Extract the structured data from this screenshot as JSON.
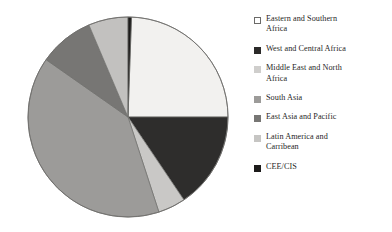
{
  "chart_data": {
    "type": "pie",
    "title": "",
    "subtitle": "",
    "xlabel": "",
    "ylabel": "",
    "grid": false,
    "legend_position": "right",
    "start_angle_deg": 0,
    "direction": "clockwise",
    "categories": [
      "Eastern and Southern Africa",
      "West and Central Africa",
      "Middle East and North Africa",
      "South Asia",
      "East Asia and Pacific",
      "Latin America and Carribean",
      "CEE/CIS"
    ],
    "values": [
      24.4,
      15.6,
      4.4,
      39.7,
      8.9,
      6.4,
      0.6
    ],
    "unit": "percent",
    "slice_colors": [
      "#f2f1ef",
      "#2e2d2c",
      "#c9c8c6",
      "#9c9b99",
      "#777674",
      "#c2c1bf",
      "#1c1b1a"
    ],
    "slices": [
      {
        "label": "Eastern and Southern Africa",
        "value": 24.4,
        "start_deg": 2,
        "end_deg": 90,
        "color": "#f2f1ef"
      },
      {
        "label": "West and Central Africa",
        "value": 15.6,
        "start_deg": 90,
        "end_deg": 146,
        "color": "#2e2d2c"
      },
      {
        "label": "Middle East and North Africa",
        "value": 4.4,
        "start_deg": 146,
        "end_deg": 162,
        "color": "#c9c8c6"
      },
      {
        "label": "South Asia",
        "value": 39.7,
        "start_deg": 162,
        "end_deg": 305,
        "color": "#9c9b99"
      },
      {
        "label": "East Asia and Pacific",
        "value": 8.9,
        "start_deg": 305,
        "end_deg": 337,
        "color": "#777674"
      },
      {
        "label": "Latin America and Carribean",
        "value": 6.4,
        "start_deg": 337,
        "end_deg": 360,
        "color": "#c2c1bf"
      },
      {
        "label": "CEE/CIS",
        "value": 0.6,
        "start_deg": 0,
        "end_deg": 2,
        "color": "#1c1b1a"
      }
    ],
    "outline_color": "#6f6e6c"
  },
  "legend": {
    "items": [
      {
        "label": "Eastern and Southern\nAfrica",
        "swatch_name": "legend-swatch-eastern-and-southern-africa",
        "fill": "#ffffff",
        "border": "#6b6a68"
      },
      {
        "label": "West and Central Africa",
        "swatch_name": "legend-swatch-west-and-central-africa",
        "fill": "#2b2a29",
        "border": "#2b2a29"
      },
      {
        "label": "Middle East and North\nAfrica",
        "swatch_name": "legend-swatch-middle-east-and-north-africa",
        "fill": "#cfcecc",
        "border": "#cfcecc"
      },
      {
        "label": "South Asia",
        "swatch_name": "legend-swatch-south-asia",
        "fill": "#9c9b99",
        "border": "#9c9b99"
      },
      {
        "label": "East Asia and Pacific",
        "swatch_name": "legend-swatch-east-asia-and-pacific",
        "fill": "#777674",
        "border": "#777674"
      },
      {
        "label": "Latin America and\nCarribean",
        "swatch_name": "legend-swatch-latin-america-and-carribean",
        "fill": "#c6c5c3",
        "border": "#c6c5c3"
      },
      {
        "label": "CEE/CIS",
        "swatch_name": "legend-swatch-cee-cis",
        "fill": "#1c1b1a",
        "border": "#1c1b1a"
      }
    ]
  }
}
